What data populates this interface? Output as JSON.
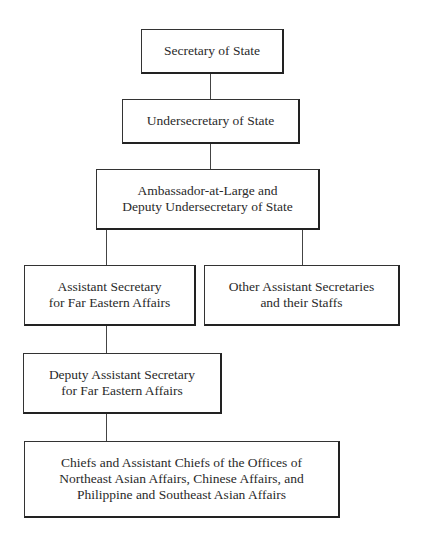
{
  "diagram": {
    "type": "org-chart",
    "nodes": [
      {
        "id": "secretary",
        "label": "Secretary of State"
      },
      {
        "id": "undersecretary",
        "label": "Undersecretary of State"
      },
      {
        "id": "ambassador",
        "label": "Ambassador-at-Large and\nDeputy Undersecretary of State"
      },
      {
        "id": "asst_far_east",
        "label": "Assistant Secretary\nfor Far Eastern Affairs"
      },
      {
        "id": "other_asst",
        "label": "Other Assistant Secretaries\nand their Staffs"
      },
      {
        "id": "deputy_asst_far_east",
        "label": "Deputy Assistant Secretary\nfor Far Eastern Affairs"
      },
      {
        "id": "chiefs",
        "label": "Chiefs and Assistant Chiefs of the Offices of\nNortheast Asian Affairs, Chinese Affairs, and\nPhilippine and Southeast Asian Affairs"
      }
    ],
    "edges": [
      [
        "secretary",
        "undersecretary"
      ],
      [
        "undersecretary",
        "ambassador"
      ],
      [
        "ambassador",
        "asst_far_east"
      ],
      [
        "ambassador",
        "other_asst"
      ],
      [
        "asst_far_east",
        "deputy_asst_far_east"
      ],
      [
        "deputy_asst_far_east",
        "chiefs"
      ]
    ]
  }
}
